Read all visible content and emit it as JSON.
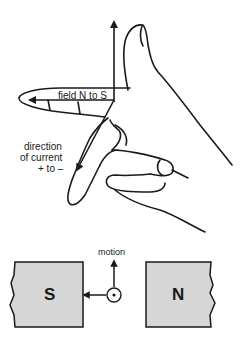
{
  "diagram": {
    "type": "Fleming's right-hand rule (generator rule)",
    "hand": {
      "labels": {
        "field": "field N to S",
        "current_line1": "direction",
        "current_line2": "of current",
        "current_line3": "+ to –"
      }
    },
    "magnets": {
      "left_pole": "S",
      "right_pole": "N",
      "motion_label": "motion"
    },
    "colors": {
      "ink": "#1a1a1a",
      "magnet_fill": "#d6d6d6",
      "background": "#ffffff"
    }
  }
}
